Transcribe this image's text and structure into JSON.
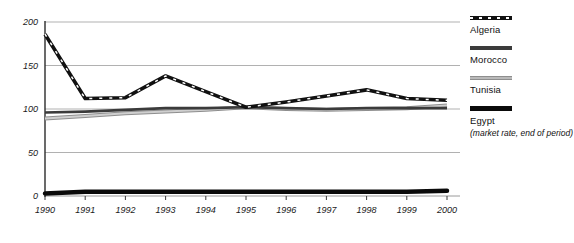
{
  "chart_data": {
    "type": "line",
    "title": "",
    "xlabel": "",
    "ylabel": "",
    "x": [
      1990,
      1991,
      1992,
      1993,
      1994,
      1995,
      1996,
      1997,
      1998,
      1999,
      2000
    ],
    "categories": [
      "1990",
      "1991",
      "1992",
      "1993",
      "1994",
      "1995",
      "1996",
      "1997",
      "1998",
      "1999",
      "2000"
    ],
    "ylim": [
      0,
      200
    ],
    "yticks": [
      0,
      50,
      100,
      150,
      200
    ],
    "ytick_labels": [
      "0",
      "50",
      "100",
      "150",
      "200"
    ],
    "grid": true,
    "grid_axis": "y",
    "legend_position": "right",
    "series": [
      {
        "name": "Algeria",
        "style": "dashed",
        "color": "#111111",
        "values": [
          186,
          112,
          113,
          138,
          120,
          102,
          108,
          115,
          122,
          112,
          110
        ]
      },
      {
        "name": "Morocco",
        "style": "solid",
        "color": "#3b3b3b",
        "values": [
          96,
          97,
          99,
          101,
          101,
          102,
          101,
          100,
          101,
          101,
          101
        ]
      },
      {
        "name": "Tunisia",
        "style": "solid-light",
        "color": "#b9b9b9",
        "values": [
          89,
          92,
          95,
          97,
          99,
          102,
          100,
          99,
          100,
          101,
          104
        ]
      },
      {
        "name": "Egypt",
        "style": "thick",
        "color": "#0a0a0a",
        "values": [
          3,
          5,
          5,
          5,
          5,
          5,
          5,
          5,
          5,
          5,
          6
        ]
      }
    ]
  },
  "legend": {
    "entries": [
      {
        "label": "Algeria"
      },
      {
        "label": "Morocco"
      },
      {
        "label": "Tunisia"
      },
      {
        "label": "Egypt"
      }
    ],
    "note": "(market rate, end of period)"
  }
}
